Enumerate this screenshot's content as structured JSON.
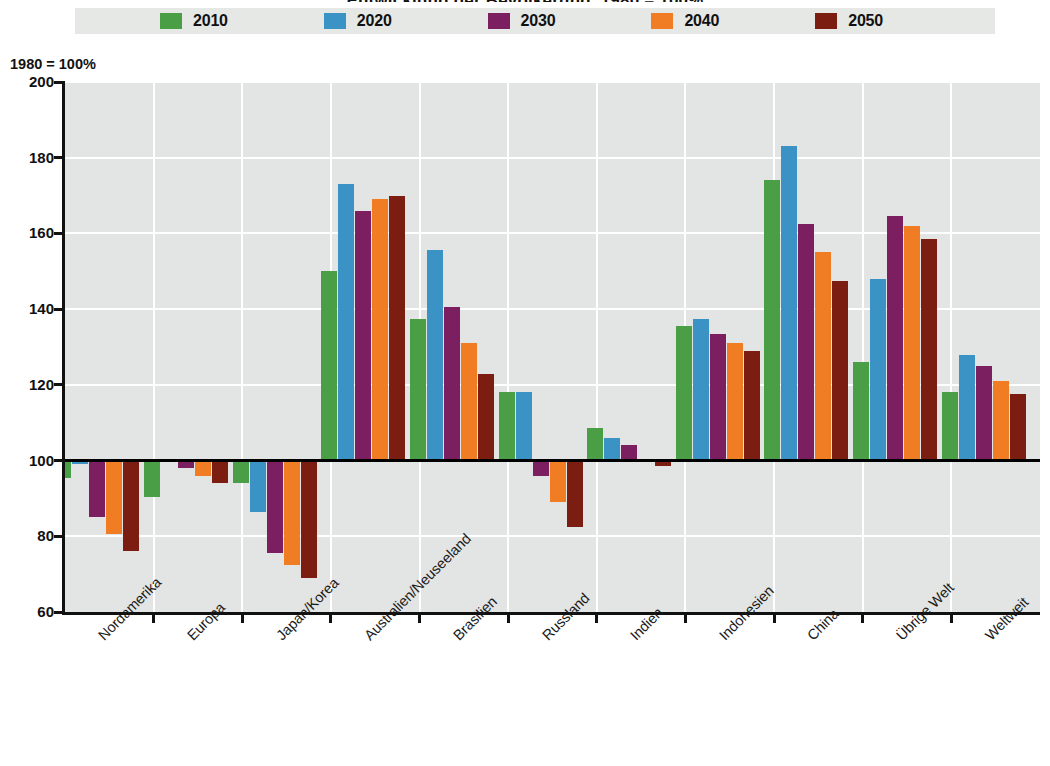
{
  "chart_data": {
    "type": "bar",
    "title": "Entwicklung der Bevölkerung, 1980 = 100%",
    "subtitle": "",
    "xlabel": "",
    "ylabel": "",
    "axis_note": "1980 = 100%",
    "ylim": [
      60,
      200
    ],
    "yticks": [
      60,
      80,
      100,
      120,
      140,
      160,
      180,
      200
    ],
    "grid": true,
    "legend_position": "top",
    "baseline": 100,
    "categories": [
      "Nordamerika",
      "Europa",
      "Japan/Korea",
      "Australien/Neuseeland",
      "Brasilien",
      "Russland",
      "Indien",
      "Indonesien",
      "China",
      "Übrige Welt",
      "Weltweit"
    ],
    "series": [
      {
        "name": "2010",
        "color": "#4a9e45",
        "values": [
          95.5,
          90.5,
          94.0,
          150.0,
          137.5,
          118.0,
          108.5,
          135.5,
          174.0,
          126.0,
          118.0
        ]
      },
      {
        "name": "2020",
        "color": "#3a93c4",
        "values": [
          99.0,
          100.5,
          86.5,
          173.0,
          155.5,
          118.0,
          106.0,
          137.5,
          183.0,
          148.0,
          128.0
        ]
      },
      {
        "name": "2030",
        "color": "#7b1f60",
        "values": [
          85.0,
          98.0,
          75.5,
          166.0,
          140.5,
          96.0,
          104.0,
          133.5,
          162.5,
          164.5,
          125.0
        ]
      },
      {
        "name": "2040",
        "color": "#f07c24",
        "values": [
          80.5,
          96.0,
          72.5,
          169.0,
          131.0,
          89.0,
          100.0,
          131.0,
          155.0,
          162.0,
          121.0
        ]
      },
      {
        "name": "2050",
        "color": "#7b1d10",
        "values": [
          76.0,
          94.0,
          69.0,
          170.0,
          123.0,
          82.5,
          98.5,
          129.0,
          147.5,
          158.5,
          117.5
        ]
      }
    ]
  },
  "legend": {
    "items": [
      {
        "label": "2010",
        "color": "#4a9e45"
      },
      {
        "label": "2020",
        "color": "#3a93c4"
      },
      {
        "label": "2030",
        "color": "#7b1f60"
      },
      {
        "label": "2040",
        "color": "#f07c24"
      },
      {
        "label": "2050",
        "color": "#7b1d10"
      }
    ]
  },
  "yaxis": {
    "labels": [
      "200",
      "180",
      "160",
      "140",
      "120",
      "100",
      "80",
      "60"
    ]
  }
}
